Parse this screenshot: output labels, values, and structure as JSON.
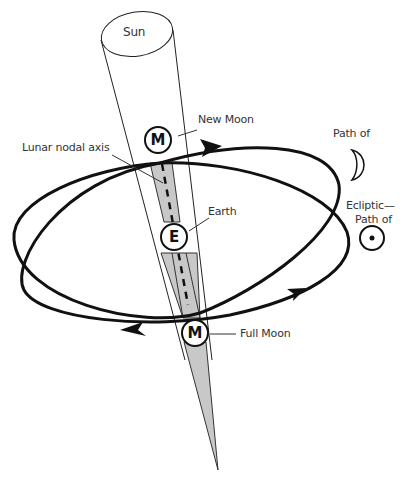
{
  "diagram": {
    "sun_label": "Sun",
    "new_moon_label": "New Moon",
    "lunar_nodal_axis_label": "Lunar nodal axis",
    "earth_label": "Earth",
    "full_moon_label": "Full Moon",
    "moon_path_label": "Path of",
    "ecliptic_label": "Ecliptic—",
    "sun_path_label": "Path of",
    "new_moon_marker": "M",
    "earth_marker": "E",
    "full_moon_marker": "M",
    "moon_symbol": "crescent-moon",
    "sun_symbol": "sun-circled-dot"
  },
  "colors": {
    "line": "#111111",
    "shadow": "#c8c8c8",
    "text": "#333333"
  }
}
